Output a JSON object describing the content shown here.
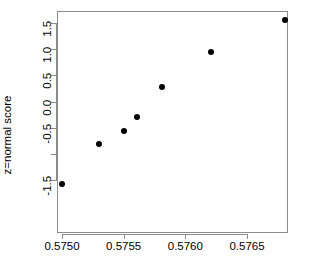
{
  "chart_data": {
    "type": "scatter",
    "title": "",
    "xlabel": "",
    "ylabel": "z=normal score",
    "xlim": [
      0.57495,
      0.5769
    ],
    "ylim": [
      -1.62,
      1.62
    ],
    "grid": false,
    "legend": null,
    "x_ticks": [
      {
        "value": 0.575,
        "label": "0.5750"
      },
      {
        "value": 0.5755,
        "label": "0.5755"
      },
      {
        "value": 0.576,
        "label": "0.5760"
      },
      {
        "value": 0.5765,
        "label": "0.5765"
      }
    ],
    "y_ticks": [
      {
        "value": 1.5,
        "label": "1.5"
      },
      {
        "value": 1.0,
        "label": "1.0"
      },
      {
        "value": 0.5,
        "label": "0.5"
      },
      {
        "value": 0.0,
        "label": "0.0"
      },
      {
        "value": -0.5,
        "label": "-0.5"
      },
      {
        "value": -1.0,
        "label": ""
      },
      {
        "value": -1.5,
        "label": "-1.5"
      }
    ],
    "series": [
      {
        "name": "normal-probability-points",
        "marker": "filled-circle",
        "color": "#000000",
        "points": [
          {
            "x": 0.575,
            "y": -1.57
          },
          {
            "x": 0.5753,
            "y": -0.81
          },
          {
            "x": 0.5755,
            "y": -0.57
          },
          {
            "x": 0.57561,
            "y": -0.3
          },
          {
            "x": 0.57581,
            "y": 0.28
          },
          {
            "x": 0.57621,
            "y": 0.95
          },
          {
            "x": 0.57681,
            "y": 1.56
          }
        ]
      }
    ],
    "axis_color": "#8c8c8c",
    "background_color": "#ffffff"
  }
}
